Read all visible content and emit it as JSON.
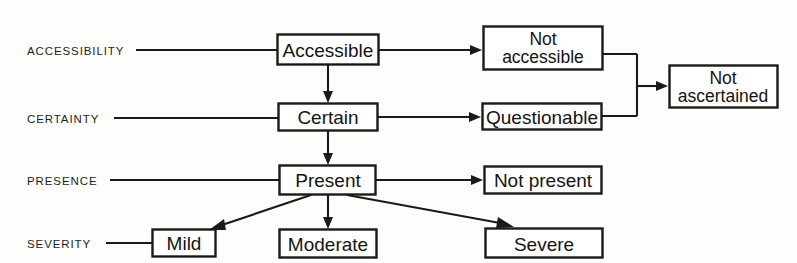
{
  "diagram": {
    "background_color": "#fdfdfb",
    "stroke_color": "#1a1a18",
    "box_fill_color": "#ffffff",
    "row_labels": [
      {
        "id": "accessibility",
        "text": "ACCESSIBILITY"
      },
      {
        "id": "certainty",
        "text": "CERTAINTY"
      },
      {
        "id": "presence",
        "text": "PRESENCE"
      },
      {
        "id": "severity",
        "text": "SEVERITY"
      }
    ],
    "nodes": [
      {
        "id": "accessible",
        "label": "Accessible",
        "lines": [
          "Accessible"
        ]
      },
      {
        "id": "not-accessible",
        "label": "Not accessible",
        "lines": [
          "Not",
          "accessible"
        ]
      },
      {
        "id": "certain",
        "label": "Certain",
        "lines": [
          "Certain"
        ]
      },
      {
        "id": "questionable",
        "label": "Questionable",
        "lines": [
          "Questionable"
        ]
      },
      {
        "id": "not-ascertained",
        "label": "Not ascertained",
        "lines": [
          "Not",
          "ascertained"
        ]
      },
      {
        "id": "present",
        "label": "Present",
        "lines": [
          "Present"
        ]
      },
      {
        "id": "not-present",
        "label": "Not present",
        "lines": [
          "Not present"
        ]
      },
      {
        "id": "mild",
        "label": "Mild",
        "lines": [
          "Mild"
        ]
      },
      {
        "id": "moderate",
        "label": "Moderate",
        "lines": [
          "Moderate"
        ]
      },
      {
        "id": "severe",
        "label": "Severe",
        "lines": [
          "Severe"
        ]
      }
    ],
    "edges": [
      {
        "from": "accessible",
        "to": "not-accessible",
        "kind": "arrow-right"
      },
      {
        "from": "accessible",
        "to": "certain",
        "kind": "arrow-down"
      },
      {
        "from": "certain",
        "to": "questionable",
        "kind": "arrow-right"
      },
      {
        "from": "certain",
        "to": "present",
        "kind": "arrow-down"
      },
      {
        "from": "not-accessible",
        "to": "not-ascertained",
        "kind": "bracket-arrow-right"
      },
      {
        "from": "questionable",
        "to": "not-ascertained",
        "kind": "bracket-arrow-right"
      },
      {
        "from": "present",
        "to": "not-present",
        "kind": "arrow-right"
      },
      {
        "from": "present",
        "to": "mild",
        "kind": "arrow-diagonal-left"
      },
      {
        "from": "present",
        "to": "moderate",
        "kind": "arrow-down"
      },
      {
        "from": "present",
        "to": "severe",
        "kind": "arrow-diagonal-right"
      }
    ]
  }
}
